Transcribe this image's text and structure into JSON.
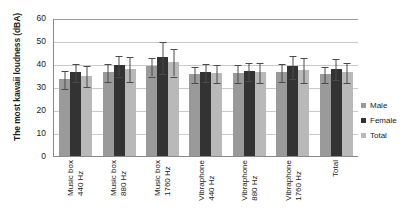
{
  "chart_data": {
    "type": "bar",
    "title": "",
    "xlabel": "",
    "ylabel": "The most kawaii loudness (dBA)",
    "ylim": [
      0,
      60
    ],
    "yticks": [
      0,
      10,
      20,
      30,
      40,
      50,
      60
    ],
    "grid": true,
    "legend_position": "right",
    "orientation": "vertical",
    "error_bars": "standard deviation",
    "categories": [
      "Music box 440 Hz",
      "Music box 880 Hz",
      "Music box 1760 Hz",
      "Vibraphone 440 Hz",
      "Vibraphone 880 Hz",
      "Vibraphone 1760 Hz",
      "Total"
    ],
    "category_lines": [
      [
        "Music box",
        "440 Hz"
      ],
      [
        "Music box",
        "880 Hz"
      ],
      [
        "Music box",
        "1760 Hz"
      ],
      [
        "Vibraphone",
        "440 Hz"
      ],
      [
        "Vibraphone",
        "880 Hz"
      ],
      [
        "Vibraphone",
        "1760 Hz"
      ],
      [
        "Total",
        ""
      ]
    ],
    "series": [
      {
        "name": "Male",
        "color": "#9a9a9a",
        "values": [
          33.5,
          36.5,
          39.0,
          35.5,
          36.0,
          36.5,
          35.5
        ],
        "errors": [
          4.0,
          4.0,
          4.0,
          3.5,
          4.0,
          4.0,
          3.5
        ]
      },
      {
        "name": "Female",
        "color": "#333333",
        "values": [
          36.5,
          39.5,
          43.0,
          36.5,
          37.0,
          39.0,
          38.0
        ],
        "errors": [
          4.0,
          4.5,
          7.0,
          4.0,
          4.0,
          5.0,
          4.5
        ]
      },
      {
        "name": "Total",
        "color": "#b9b9b9",
        "values": [
          35.0,
          38.0,
          41.0,
          36.0,
          36.5,
          37.5,
          36.5
        ],
        "errors": [
          4.5,
          5.5,
          6.0,
          4.0,
          4.5,
          5.5,
          4.5
        ]
      }
    ]
  },
  "legend": {
    "items": [
      {
        "label": "Male",
        "color": "#9a9a9a"
      },
      {
        "label": "Female",
        "color": "#333333"
      },
      {
        "label": "Total",
        "color": "#b9b9b9"
      }
    ]
  }
}
